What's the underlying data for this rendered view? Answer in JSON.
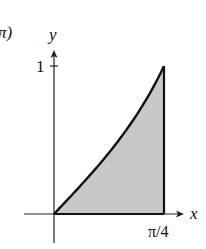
{
  "chart_data": {
    "type": "area",
    "title": "",
    "function": "y = tan x",
    "xlabel": "x",
    "ylabel": "y",
    "xlim": [
      0,
      0.785398
    ],
    "ylim": [
      0,
      1
    ],
    "x_ticks": [
      {
        "value": 0.785398,
        "label": "π/4"
      }
    ],
    "y_ticks": [
      {
        "value": 1,
        "label": "1"
      }
    ],
    "x": [
      0,
      0.0982,
      0.1963,
      0.2945,
      0.3927,
      0.4909,
      0.589,
      0.6872,
      0.7854
    ],
    "values": [
      0,
      0.0985,
      0.1989,
      0.3033,
      0.4142,
      0.5345,
      0.6682,
      0.8207,
      1.0
    ],
    "shaded_region": "area under curve from x=0 to x=π/4",
    "grid": false,
    "legend": null
  },
  "labels": {
    "corner_fragment": "π)",
    "y_axis": "y",
    "x_axis": "x",
    "y_tick_1": "1",
    "x_tick_end": "π/4"
  },
  "colors": {
    "fill": "#c8c8c8",
    "stroke": "#111111",
    "axis": "#222222"
  }
}
